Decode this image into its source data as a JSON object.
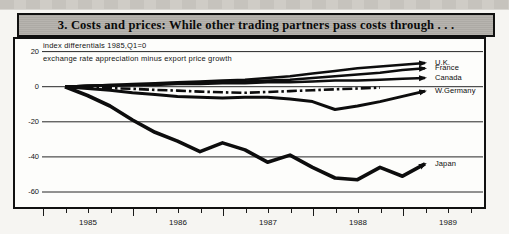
{
  "figure": {
    "kind": "scanned report chart panel",
    "ink_color": "#0d0d0d",
    "title_bar_bg": "#b2afa9"
  },
  "chart_data": {
    "type": "line",
    "title": "3. Costs and prices: While other trading partners pass costs through . . .",
    "subtitle1": "index differentials 1985,Q1=0",
    "subtitle2": "exchange rate appreciation minus export price growth",
    "x_start": "1985 Q1",
    "x_interval": "quarter",
    "x_year_labels": [
      "1985",
      "1986",
      "1987",
      "1988",
      "1989"
    ],
    "y_ticks": [
      20,
      0,
      -20,
      -40,
      -60
    ],
    "ylim": [
      -65,
      22
    ],
    "grid": "horizontal gridlines at y ticks",
    "legend_position": "labels at right end of each line",
    "ink_color": "#0d0d0d",
    "series": [
      {
        "name": "U.K.",
        "style": "solid",
        "stroke_width": 2.5,
        "values": [
          0,
          0.5,
          1,
          1.5,
          2,
          2.5,
          3,
          3.5,
          4,
          5,
          6,
          7.5,
          9,
          10.5,
          11.5,
          12.5,
          13.5
        ]
      },
      {
        "name": "France",
        "style": "solid",
        "stroke_width": 2.5,
        "values": [
          0,
          0.5,
          1,
          1,
          1.5,
          2,
          2.5,
          3,
          3,
          3.5,
          4,
          5,
          6,
          7,
          8,
          9.5,
          10.5
        ]
      },
      {
        "name": "Canada",
        "style": "solid",
        "stroke_width": 2.5,
        "values": [
          0,
          0.5,
          0.5,
          1,
          1,
          1.5,
          1.5,
          2,
          2,
          2.5,
          2.5,
          3,
          3.5,
          3.5,
          4,
          4.5,
          5
        ]
      },
      {
        "name": "",
        "style": "dash-dot",
        "stroke_width": 2.6,
        "values": [
          0,
          -0.3,
          -0.8,
          -1.2,
          -1.8,
          -2.2,
          -2.8,
          -3.2,
          -3.5,
          -3,
          -2.5,
          -2,
          -1.5,
          -1,
          -0.5
        ]
      },
      {
        "name": "W.Germany",
        "style": "solid",
        "stroke_width": 3,
        "values": [
          0,
          -1,
          -2,
          -3.5,
          -4.5,
          -5.5,
          -6,
          -6.5,
          -6,
          -6,
          -7,
          -8.5,
          -13,
          -11,
          -8.5,
          -5.5,
          -2.5
        ]
      },
      {
        "name": "Japan",
        "style": "solid",
        "stroke_width": 3.6,
        "values": [
          0,
          -5,
          -11,
          -19,
          -26,
          -31,
          -37,
          -32,
          -36,
          -43,
          -39,
          -46,
          -52,
          -53,
          -46,
          -51,
          -44
        ]
      }
    ]
  }
}
